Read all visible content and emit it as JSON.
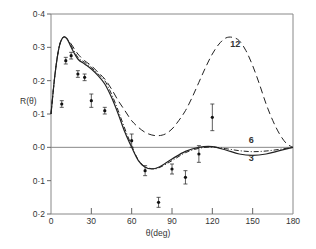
{
  "chart_data": {
    "type": "line",
    "title": "",
    "xlabel": "θ(deg)",
    "ylabel": "R(θ)",
    "xlim": [
      0,
      180
    ],
    "ylim": [
      -0.2,
      0.4
    ],
    "x_ticks": [
      0,
      30,
      60,
      90,
      120,
      150,
      180
    ],
    "x_tick_labels": [
      "0",
      "30",
      "60",
      "90",
      "120",
      "150",
      "180"
    ],
    "y_ticks": [
      0.4,
      0.3,
      0.2,
      0.1,
      0.0,
      -0.1,
      -0.2
    ],
    "y_tick_labels": [
      "0·4",
      "0·3",
      "0·2",
      "0·1",
      "0·0",
      "0·1",
      "0·2"
    ],
    "grid": false,
    "zero_line": true,
    "legend": "inline curve labels",
    "series": [
      {
        "name": "3",
        "style": "solid",
        "x": [
          0,
          3,
          6,
          9,
          12,
          15,
          20,
          25,
          30,
          35,
          40,
          45,
          50,
          55,
          60,
          65,
          70,
          75,
          80,
          90,
          100,
          110,
          120,
          130,
          140,
          150,
          160,
          170,
          180
        ],
        "y": [
          0.1,
          0.22,
          0.3,
          0.33,
          0.325,
          0.3,
          0.265,
          0.25,
          0.235,
          0.215,
          0.19,
          0.15,
          0.1,
          0.045,
          0.0,
          -0.04,
          -0.06,
          -0.065,
          -0.06,
          -0.035,
          -0.012,
          0.0,
          0.002,
          -0.008,
          -0.02,
          -0.024,
          -0.02,
          -0.01,
          0.0
        ]
      },
      {
        "name": "6",
        "style": "dash-dot",
        "x": [
          0,
          3,
          6,
          9,
          12,
          15,
          20,
          25,
          30,
          35,
          40,
          45,
          50,
          55,
          60,
          65,
          70,
          75,
          80,
          90,
          100,
          110,
          120,
          130,
          140,
          150,
          160,
          170,
          180
        ],
        "y": [
          0.1,
          0.22,
          0.3,
          0.33,
          0.325,
          0.305,
          0.27,
          0.255,
          0.24,
          0.22,
          0.2,
          0.16,
          0.11,
          0.055,
          0.005,
          -0.038,
          -0.058,
          -0.064,
          -0.062,
          -0.04,
          -0.016,
          -0.003,
          0.001,
          -0.004,
          -0.01,
          -0.013,
          -0.011,
          -0.006,
          0.0
        ]
      },
      {
        "name": "12",
        "style": "dashed",
        "x": [
          0,
          3,
          6,
          9,
          12,
          15,
          20,
          25,
          30,
          35,
          40,
          45,
          50,
          55,
          60,
          65,
          70,
          75,
          80,
          85,
          90,
          95,
          100,
          105,
          110,
          115,
          120,
          125,
          130,
          135,
          140,
          145,
          150,
          155,
          160,
          165,
          170,
          175,
          180
        ],
        "y": [
          0.1,
          0.22,
          0.3,
          0.33,
          0.325,
          0.31,
          0.28,
          0.26,
          0.245,
          0.225,
          0.205,
          0.175,
          0.14,
          0.11,
          0.08,
          0.06,
          0.045,
          0.037,
          0.035,
          0.04,
          0.055,
          0.08,
          0.11,
          0.15,
          0.195,
          0.24,
          0.28,
          0.31,
          0.328,
          0.33,
          0.32,
          0.29,
          0.245,
          0.19,
          0.13,
          0.08,
          0.04,
          0.012,
          0.0
        ]
      }
    ],
    "measurements": {
      "name": "experimental data",
      "style": "points with error bars",
      "points": [
        {
          "x": 8,
          "y": 0.13,
          "err": 0.01
        },
        {
          "x": 11,
          "y": 0.26,
          "err": 0.01
        },
        {
          "x": 15,
          "y": 0.275,
          "err": 0.01
        },
        {
          "x": 20,
          "y": 0.22,
          "err": 0.01
        },
        {
          "x": 25,
          "y": 0.21,
          "err": 0.01
        },
        {
          "x": 30,
          "y": 0.14,
          "err": 0.02
        },
        {
          "x": 40,
          "y": 0.11,
          "err": 0.01
        },
        {
          "x": 60,
          "y": 0.02,
          "err": 0.02
        },
        {
          "x": 70,
          "y": -0.07,
          "err": 0.015
        },
        {
          "x": 80,
          "y": -0.165,
          "err": 0.015
        },
        {
          "x": 90,
          "y": -0.065,
          "err": 0.015
        },
        {
          "x": 100,
          "y": -0.09,
          "err": 0.02
        },
        {
          "x": 110,
          "y": -0.02,
          "err": 0.025
        },
        {
          "x": 120,
          "y": 0.09,
          "err": 0.04
        }
      ]
    },
    "annotations": [
      {
        "text": "12",
        "x": 137,
        "y": 0.3
      },
      {
        "text": "6",
        "x": 149,
        "y": 0.012
      },
      {
        "text": "3",
        "x": 149,
        "y": -0.042
      }
    ]
  }
}
